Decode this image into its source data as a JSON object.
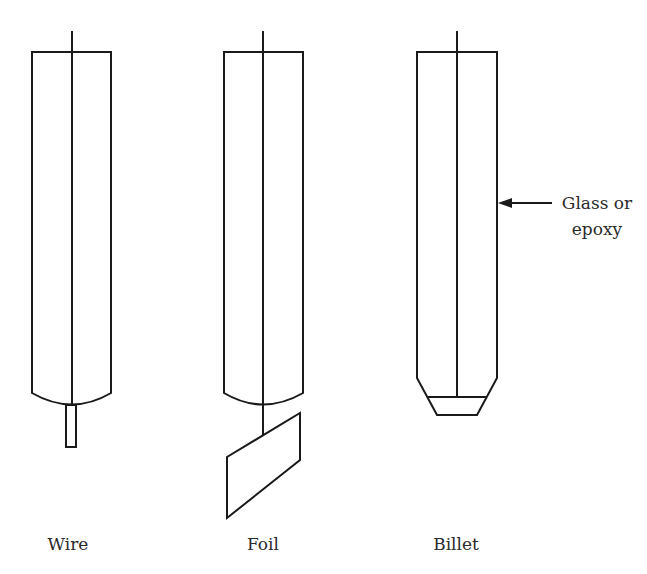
{
  "figure": {
    "labels": {
      "wire": "Wire",
      "foil": "Foil",
      "billet": "Billet"
    },
    "annotation": {
      "line1": "Glass or",
      "line2": "epoxy"
    },
    "stroke_color": "#1a1a1a",
    "background": "#ffffff"
  }
}
